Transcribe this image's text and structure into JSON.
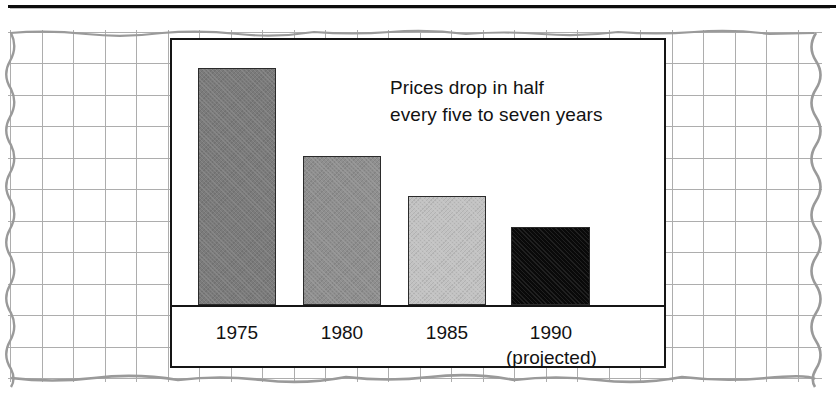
{
  "figure": {
    "top_rule_color": "#0d0d0d",
    "paper": {
      "kind": "graph-paper",
      "grid_color": "#adadad",
      "edge_color": "#9a9a9a",
      "background": "#ffffff"
    }
  },
  "chart_data": {
    "type": "bar",
    "title": "",
    "subtitle": "",
    "annotation": {
      "line1": "Prices drop in half",
      "line2": "every five to seven years"
    },
    "categories": [
      "1975",
      "1980",
      "1985",
      "1990"
    ],
    "category_sublabels": [
      "",
      "",
      "",
      "(projected)"
    ],
    "values": [
      100,
      63,
      46,
      33
    ],
    "values_unit": "relative price index (1975 = 100)",
    "series": [
      {
        "name": "Price",
        "values": [
          100,
          63,
          46,
          33
        ]
      }
    ],
    "bar_colors": [
      "#7b7b7b",
      "#8f8f8f",
      "#c2c2c2",
      "#0a0a0a"
    ],
    "bar_border_color": "#2b2b2b",
    "xlabel": "",
    "ylabel": "",
    "ylim": [
      0,
      112
    ],
    "grid": false,
    "legend": "none",
    "axis_line_color": "#151515",
    "panel_background": "#ffffff",
    "panel_border_color": "#151515"
  }
}
